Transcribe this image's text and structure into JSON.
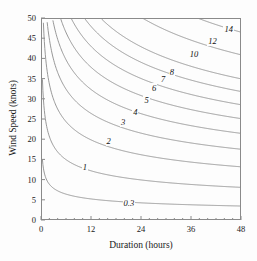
{
  "chart_data": {
    "type": "line",
    "subtype": "contour",
    "title": "",
    "xlabel": "Duration (hours)",
    "ylabel": "Wind Speed (knots)",
    "xlim": [
      0,
      48
    ],
    "ylim": [
      0,
      50
    ],
    "xticks": [
      0,
      12,
      24,
      36,
      48
    ],
    "xtick_labels": [
      "0",
      "12",
      "24",
      "36",
      "48"
    ],
    "xminor_step": 2,
    "yticks": [
      0,
      5,
      10,
      15,
      20,
      25,
      30,
      35,
      40,
      45,
      50
    ],
    "ytick_labels": [
      "0",
      "5",
      "10",
      "15",
      "20",
      "25",
      "30",
      "35",
      "40",
      "45",
      "50"
    ],
    "grid": false,
    "legend": "none",
    "line_color": "#8c8c8c",
    "frame_color": "#8a8a8a",
    "background": "#fdfdfd",
    "contour_levels": [
      0.3,
      1,
      2,
      3,
      4,
      5,
      6,
      7,
      8,
      10,
      12,
      14
    ],
    "contour_labels": [
      "0.3",
      "1",
      "2",
      "3",
      "4",
      "5",
      "6",
      "7",
      "8",
      "10",
      "12",
      "14"
    ],
    "contour_label_positions": [
      {
        "label": "0.3",
        "x": 21.5,
        "y": 4.2
      },
      {
        "label": "1",
        "x": 10.5,
        "y": 13.2
      },
      {
        "label": "2",
        "x": 16.2,
        "y": 19.6
      },
      {
        "label": "3",
        "x": 19.7,
        "y": 24.2
      },
      {
        "label": "4",
        "x": 22.6,
        "y": 26.8
      },
      {
        "label": "5",
        "x": 25.3,
        "y": 29.8
      },
      {
        "label": "6",
        "x": 27.1,
        "y": 32.6
      },
      {
        "label": "7",
        "x": 29.3,
        "y": 35.0
      },
      {
        "label": "8",
        "x": 31.4,
        "y": 36.7
      },
      {
        "label": "10",
        "x": 36.2,
        "y": 41.0
      },
      {
        "label": "12",
        "x": 40.6,
        "y": 44.4
      },
      {
        "label": "14",
        "x": 44.5,
        "y": 47.3
      }
    ],
    "curve_model": "H = k * U^1.42 * t^0.42 (fetch-limited / duration-limited wave growth nomogram)",
    "series": [
      {
        "name": "0.3",
        "points": [
          [
            1.9,
            50
          ],
          [
            2.1,
            44
          ],
          [
            2.4,
            38
          ],
          [
            2.9,
            32
          ],
          [
            3.6,
            27
          ],
          [
            4.6,
            22
          ],
          [
            6.2,
            18
          ],
          [
            8.5,
            14.5
          ],
          [
            12,
            11.5
          ],
          [
            17,
            9.0
          ],
          [
            24,
            7.0
          ],
          [
            32,
            5.6
          ],
          [
            40,
            4.6
          ],
          [
            48,
            4.0
          ]
        ]
      },
      {
        "name": "1",
        "points": [
          [
            4.5,
            50
          ],
          [
            5.0,
            45
          ],
          [
            5.7,
            40
          ],
          [
            6.8,
            35
          ],
          [
            8.4,
            30
          ],
          [
            10.8,
            25.5
          ],
          [
            14.2,
            21.5
          ],
          [
            19,
            18
          ],
          [
            25,
            15
          ],
          [
            32,
            12.8
          ],
          [
            40,
            11.2
          ],
          [
            48,
            10.0
          ]
        ]
      },
      {
        "name": "2",
        "points": [
          [
            8.8,
            50
          ],
          [
            9.8,
            45
          ],
          [
            11.2,
            40
          ],
          [
            13.3,
            35
          ],
          [
            16.4,
            30
          ],
          [
            21,
            26
          ],
          [
            27,
            22.5
          ],
          [
            34,
            19.8
          ],
          [
            41,
            17.8
          ],
          [
            48,
            16.3
          ]
        ]
      },
      {
        "name": "3",
        "points": [
          [
            13.2,
            50
          ],
          [
            14.7,
            45
          ],
          [
            16.8,
            40
          ],
          [
            20,
            35
          ],
          [
            24.7,
            31
          ],
          [
            31,
            27.5
          ],
          [
            38,
            24.8
          ],
          [
            45,
            22.7
          ],
          [
            48,
            22.0
          ]
        ]
      },
      {
        "name": "4",
        "points": [
          [
            17.8,
            50
          ],
          [
            19.8,
            45
          ],
          [
            22.6,
            40
          ],
          [
            27,
            36
          ],
          [
            33,
            32.3
          ],
          [
            40,
            29.3
          ],
          [
            48,
            26.8
          ]
        ]
      },
      {
        "name": "5",
        "points": [
          [
            22.4,
            50
          ],
          [
            24.9,
            45
          ],
          [
            28.5,
            41
          ],
          [
            34,
            37.3
          ],
          [
            41,
            34.0
          ],
          [
            48,
            31.6
          ]
        ]
      },
      {
        "name": "6",
        "points": [
          [
            27.2,
            50
          ],
          [
            30.2,
            45.5
          ],
          [
            34.5,
            42
          ],
          [
            41,
            38.6
          ],
          [
            48,
            36.1
          ]
        ]
      },
      {
        "name": "7",
        "points": [
          [
            32.0,
            50
          ],
          [
            35.6,
            46
          ],
          [
            40.5,
            42.8
          ],
          [
            48,
            39.6
          ]
        ]
      },
      {
        "name": "8",
        "points": [
          [
            36.9,
            50
          ],
          [
            41,
            47
          ],
          [
            48,
            43.3
          ]
        ]
      },
      {
        "name": "10",
        "points": [
          [
            47.0,
            50
          ],
          [
            48,
            49.5
          ]
        ]
      },
      {
        "name": "12",
        "points": []
      },
      {
        "name": "14",
        "points": []
      }
    ]
  },
  "axes": {
    "x_label": "Duration (hours)",
    "y_label": "Wind Speed (knots)"
  }
}
